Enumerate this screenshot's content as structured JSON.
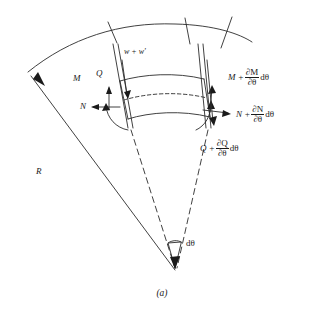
{
  "figure": {
    "caption": "(a)"
  },
  "labels": {
    "radius": "R",
    "deflection": "w + w'",
    "moment_left": "M",
    "shear_left": "Q",
    "normal_left": "N",
    "angle_increment": "dθ",
    "moment_right": {
      "base": "M +",
      "numerator": "∂M",
      "denominator": "∂θ",
      "differential": "dθ"
    },
    "normal_right": {
      "base": "N +",
      "numerator": "∂N",
      "denominator": "∂θ",
      "differential": "dθ"
    },
    "shear_right": {
      "base": "Q +",
      "numerator": "∂Q",
      "denominator": "∂θ",
      "differential": "dθ"
    }
  },
  "colors": {
    "ink": "#1a1a1a",
    "line": "#2b2b2b",
    "background": "#ffffff"
  }
}
